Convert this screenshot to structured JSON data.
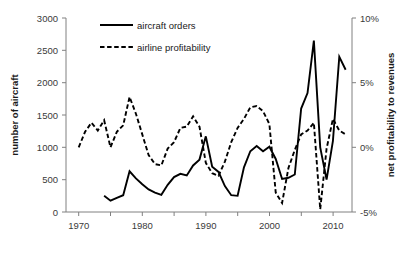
{
  "chart_data": {
    "type": "line",
    "title": "",
    "xlabel": "",
    "ylabel": "number of aircraft",
    "y2label": "net profitability to revenues",
    "grid": false,
    "legend_position": "top-center",
    "xlim": [
      1968,
      2013
    ],
    "xticks": [
      1970,
      1980,
      1990,
      2000,
      2010
    ],
    "xtick_labels": [
      "1970",
      "1980",
      "1990",
      "2000",
      "2010"
    ],
    "xminor_ticks": [
      1975,
      1985,
      1995,
      2005
    ],
    "ylim": [
      0,
      3000
    ],
    "yticks": [
      0,
      500,
      1000,
      1500,
      2000,
      2500,
      3000
    ],
    "ytick_labels": [
      "0",
      "500",
      "1000",
      "1500",
      "2000",
      "2500",
      "3000"
    ],
    "y2lim": [
      -5,
      10
    ],
    "y2ticks": [
      -5,
      0,
      5,
      10
    ],
    "y2tick_labels": [
      "-5%",
      "0%",
      "5%",
      "10%"
    ],
    "series": [
      {
        "name": "aircraft orders",
        "axis": "left",
        "style": "solid",
        "color": "#000000",
        "x": [
          1974,
          1975,
          1976,
          1977,
          1978,
          1979,
          1980,
          1981,
          1982,
          1983,
          1984,
          1985,
          1986,
          1987,
          1988,
          1989,
          1990,
          1991,
          1992,
          1993,
          1994,
          1995,
          1996,
          1997,
          1998,
          1999,
          2000,
          2001,
          2002,
          2003,
          2004,
          2005,
          2006,
          2007,
          2008,
          2009,
          2010,
          2011,
          2012
        ],
        "y": [
          250,
          175,
          220,
          260,
          630,
          520,
          430,
          350,
          300,
          265,
          420,
          540,
          590,
          565,
          720,
          810,
          1170,
          700,
          620,
          400,
          260,
          250,
          690,
          940,
          1020,
          940,
          1010,
          820,
          510,
          530,
          580,
          1600,
          1840,
          2650,
          1000,
          500,
          1100,
          2400,
          2200
        ]
      },
      {
        "name": "airline profitability",
        "axis": "right",
        "style": "dashed",
        "color": "#000000",
        "x": [
          1970,
          1971,
          1972,
          1973,
          1974,
          1975,
          1976,
          1977,
          1978,
          1979,
          1980,
          1981,
          1982,
          1983,
          1984,
          1985,
          1986,
          1987,
          1988,
          1989,
          1990,
          1991,
          1992,
          1993,
          1994,
          1995,
          1996,
          1997,
          1998,
          1999,
          2000,
          2001,
          2002,
          2003,
          2004,
          2005,
          2006,
          2007,
          2008,
          2009,
          2010,
          2011,
          2012
        ],
        "y": [
          0.0,
          1.2,
          1.9,
          1.3,
          2.1,
          0.0,
          1.2,
          1.7,
          3.9,
          2.6,
          1.0,
          -0.6,
          -1.3,
          -1.4,
          -0.1,
          0.4,
          1.5,
          1.6,
          2.4,
          1.6,
          -1.2,
          -2.0,
          -2.2,
          -1.1,
          0.4,
          1.5,
          2.2,
          3.1,
          3.2,
          2.8,
          1.8,
          -3.5,
          -4.3,
          -1.6,
          -0.2,
          1.0,
          1.3,
          1.9,
          -4.8,
          -0.1,
          2.2,
          1.3,
          1.0
        ]
      }
    ],
    "legend": [
      {
        "label": "aircraft orders",
        "style": "solid"
      },
      {
        "label": "airline profitability",
        "style": "dashed"
      }
    ]
  }
}
